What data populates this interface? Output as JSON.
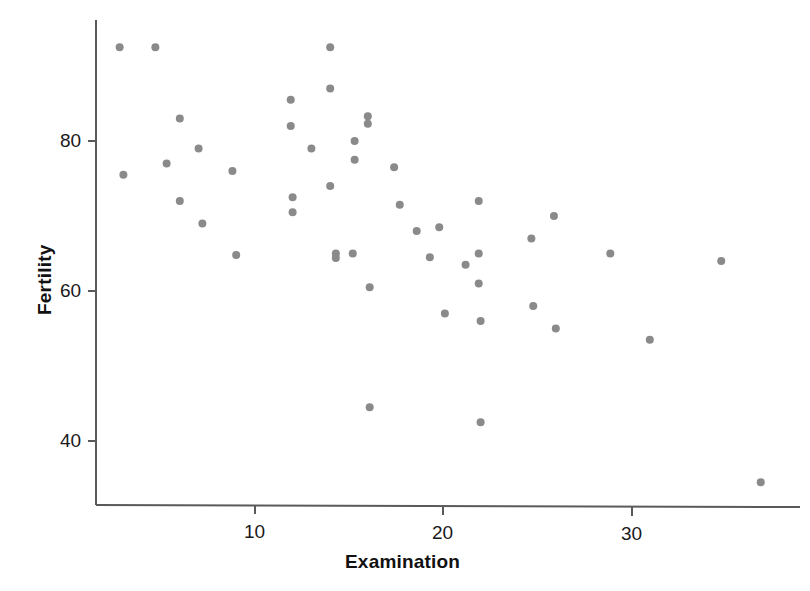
{
  "chart_data": {
    "type": "scatter",
    "title": "",
    "xlabel": "Examination",
    "ylabel": "Fertility",
    "xlim": [
      2,
      37.5
    ],
    "ylim": [
      33,
      93.5
    ],
    "xticks": [
      10,
      20,
      30
    ],
    "xtick_labels": [
      "10",
      "20",
      "30"
    ],
    "yticks": [
      40,
      60,
      80
    ],
    "ytick_labels": [
      "40",
      "60",
      "80"
    ],
    "grid": false,
    "legend": null,
    "marker_color": "#8a8a8a",
    "marker_size_px": 8,
    "axis_color": "#5a5a5a",
    "series": [
      {
        "name": "Swiss provinces",
        "x": [
          3,
          5,
          6,
          7,
          7,
          9,
          15,
          6,
          12,
          12,
          12,
          14,
          14,
          14,
          16,
          16,
          16,
          16,
          16,
          16,
          14,
          15,
          15,
          16,
          17,
          18,
          19,
          20,
          21,
          22,
          22,
          22,
          22,
          22,
          22,
          25,
          25,
          26,
          26,
          29,
          31,
          35,
          37,
          9,
          12,
          14,
          21,
          20
        ],
        "y": [
          75.5,
          92.5,
          83,
          79,
          69,
          76,
          76.5,
          77,
          85.5,
          82,
          72.5,
          87,
          92.5,
          74,
          83,
          82.5,
          80,
          77.5,
          65,
          60.5,
          79,
          74.5,
          68.5,
          44.5,
          71.5,
          68,
          64.5,
          68.5,
          63.5,
          72,
          65,
          61,
          56,
          42.5,
          65,
          67,
          58,
          70,
          55,
          65,
          53.5,
          64,
          34.5,
          64.5,
          70.5,
          65,
          57,
          64.8
        ],
        "points": [
          {
            "x": 3,
            "y": 75.5
          },
          {
            "x": 4.7,
            "y": 92.5
          },
          {
            "x": 2.8,
            "y": 92.5
          },
          {
            "x": 5.3,
            "y": 77
          },
          {
            "x": 6.0,
            "y": 83
          },
          {
            "x": 6.0,
            "y": 72
          },
          {
            "x": 7.0,
            "y": 79
          },
          {
            "x": 7.2,
            "y": 69
          },
          {
            "x": 8.8,
            "y": 76
          },
          {
            "x": 9.0,
            "y": 64.8
          },
          {
            "x": 11.9,
            "y": 85.5
          },
          {
            "x": 11.9,
            "y": 82
          },
          {
            "x": 12.0,
            "y": 72.5
          },
          {
            "x": 12.0,
            "y": 70.5
          },
          {
            "x": 13.0,
            "y": 79
          },
          {
            "x": 14.0,
            "y": 92.5
          },
          {
            "x": 14.0,
            "y": 87
          },
          {
            "x": 14.0,
            "y": 74
          },
          {
            "x": 14.3,
            "y": 65
          },
          {
            "x": 14.3,
            "y": 64.4
          },
          {
            "x": 15.3,
            "y": 80
          },
          {
            "x": 15.3,
            "y": 77.5
          },
          {
            "x": 15.2,
            "y": 65
          },
          {
            "x": 16.0,
            "y": 83.3
          },
          {
            "x": 16.0,
            "y": 82.3
          },
          {
            "x": 16.1,
            "y": 60.5
          },
          {
            "x": 16.1,
            "y": 44.5
          },
          {
            "x": 17.4,
            "y": 76.5
          },
          {
            "x": 17.7,
            "y": 71.5
          },
          {
            "x": 18.6,
            "y": 68
          },
          {
            "x": 19.3,
            "y": 64.5
          },
          {
            "x": 19.8,
            "y": 68.5
          },
          {
            "x": 20.1,
            "y": 57
          },
          {
            "x": 21.2,
            "y": 63.5
          },
          {
            "x": 21.9,
            "y": 72
          },
          {
            "x": 21.9,
            "y": 65
          },
          {
            "x": 21.9,
            "y": 61
          },
          {
            "x": 22.0,
            "y": 56
          },
          {
            "x": 22.0,
            "y": 42.5
          },
          {
            "x": 24.7,
            "y": 67
          },
          {
            "x": 24.8,
            "y": 58
          },
          {
            "x": 25.9,
            "y": 70
          },
          {
            "x": 26.0,
            "y": 55
          },
          {
            "x": 28.9,
            "y": 65
          },
          {
            "x": 31.0,
            "y": 53.5
          },
          {
            "x": 34.8,
            "y": 64
          },
          {
            "x": 36.9,
            "y": 34.5
          }
        ]
      }
    ]
  },
  "axes": {
    "y_tick_values": [
      "80",
      "60",
      "40"
    ],
    "x_tick_values": [
      "10",
      "20",
      "30"
    ],
    "y_title": "Fertility",
    "x_title": "Examination"
  },
  "geometry": {
    "x_pixel_at_10": 255,
    "x_pixel_at_20": 443,
    "x_pixel_at_30": 632,
    "y_pixel_at_80": 141,
    "y_pixel_at_60": 291,
    "y_pixel_at_40": 441
  }
}
